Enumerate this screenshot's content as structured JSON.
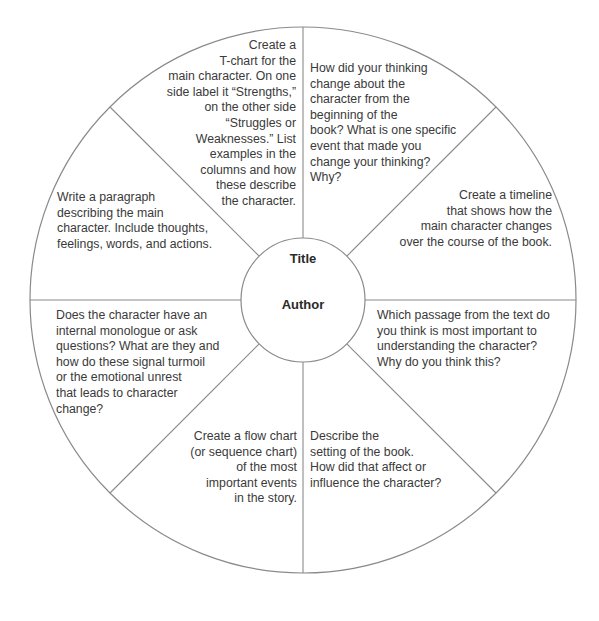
{
  "diagram": {
    "type": "wheel-graphic-organizer",
    "center": {
      "title_label": "Title",
      "author_label": "Author"
    },
    "colors": {
      "line": "#8a8a8a",
      "text": "#3a3a3a",
      "background": "#ffffff"
    },
    "wedges": [
      {
        "position": "top-left",
        "text": "Create a\nT-chart for the\nmain character. On one\nside label it “Strengths,”\non the other side\n“Struggles or\nWeaknesses.” List\nexamples in the\ncolumns and how\nthese describe\nthe character."
      },
      {
        "position": "top-right",
        "text": "How did your thinking\nchange about the\ncharacter from the\nbeginning of the\nbook? What is one specific\nevent that made you\nchange your thinking?\nWhy?"
      },
      {
        "position": "right-upper",
        "text": "Create a timeline\nthat shows how the\nmain character changes\nover the course of the book."
      },
      {
        "position": "right-lower",
        "text": "Which passage from the text do\nyou think is most important to\nunderstanding the character?\nWhy do you think this?"
      },
      {
        "position": "bottom-right",
        "text": "Describe the\nsetting of the book.\nHow did that affect or\ninfluence the character?"
      },
      {
        "position": "bottom-left",
        "text": "Create a flow chart\n(or sequence chart)\nof the most\nimportant events\nin the story."
      },
      {
        "position": "left-lower",
        "text": "Does the character have an\ninternal monologue or ask\nquestions? What are they and\nhow do these signal turmoil\nor the emotional unrest\nthat leads to character\nchange?"
      },
      {
        "position": "left-upper",
        "text": "Write a paragraph\ndescribing the main\ncharacter. Include thoughts,\nfeelings, words, and actions."
      }
    ]
  }
}
